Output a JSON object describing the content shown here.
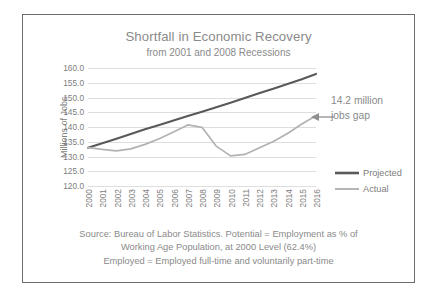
{
  "chart_data": {
    "type": "line",
    "title": "Shortfall in Economic Recovery",
    "subtitle": "from 2001 and 2008 Recessions",
    "xlabel": "",
    "ylabel": "Millions of Jobs",
    "ylim": [
      120.0,
      160.0
    ],
    "ytick_step": 5.0,
    "ytick_labels": [
      "160.0",
      "155.0",
      "150.0",
      "145.0",
      "140.0",
      "135.0",
      "130.0",
      "125.0",
      "120.0"
    ],
    "grid": true,
    "legend_position": "right",
    "categories": [
      "2000",
      "2001",
      "2002",
      "2003",
      "2004",
      "2005",
      "2006",
      "2007",
      "2008",
      "2009",
      "2010",
      "2011",
      "2012",
      "2013",
      "2014",
      "2015",
      "2016"
    ],
    "series": [
      {
        "name": "Projected",
        "color": "#595959",
        "values": [
          133.0,
          134.5,
          136.0,
          137.6,
          139.2,
          140.7,
          142.2,
          143.7,
          145.2,
          146.7,
          148.2,
          149.8,
          151.4,
          153.0,
          154.6,
          156.2,
          158.0
        ]
      },
      {
        "name": "Actual",
        "color": "#b2b2b2",
        "values": [
          133.0,
          132.4,
          131.9,
          132.6,
          134.1,
          136.0,
          138.3,
          140.7,
          139.9,
          133.5,
          130.2,
          130.7,
          132.9,
          135.1,
          137.8,
          141.0,
          143.8
        ]
      }
    ],
    "annotations": [
      {
        "text_line1": "14.2 million",
        "text_line2": "jobs gap",
        "arrow": "left-arrow"
      }
    ]
  },
  "annotation": {
    "line1": "14.2 million",
    "line2": "jobs gap"
  },
  "legend": {
    "items": [
      {
        "label": "Projected"
      },
      {
        "label": "Actual"
      }
    ]
  },
  "footnote": {
    "line1": "Source: Bureau of Labor Statistics.  Potential = Employment as % of",
    "line2": "Working Age Population, at 2000 Level  (62.4%)",
    "line3": "Employed = Employed full-time and voluntarily part-time"
  },
  "colors": {
    "projected": "#595959",
    "actual": "#b2b2b2",
    "grid": "#dedede",
    "text": "#8a8a8a",
    "border": "#6b6b6b"
  }
}
